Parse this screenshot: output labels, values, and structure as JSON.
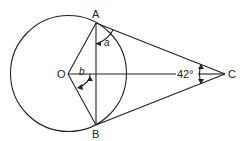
{
  "diagram": {
    "points": {
      "A": {
        "label": "A",
        "x": 96,
        "y": 23
      },
      "B": {
        "label": "B",
        "x": 96,
        "y": 125
      },
      "O": {
        "label": "O",
        "x": 68,
        "y": 74
      },
      "C": {
        "label": "C",
        "x": 225,
        "y": 74
      }
    },
    "circle": {
      "center": "O",
      "radius": 58
    },
    "angles": {
      "a": {
        "label": "a"
      },
      "b": {
        "label": "b"
      },
      "C": {
        "label": "42°"
      }
    },
    "colors": {
      "stroke": "#222222",
      "background": "#ffffff"
    }
  }
}
